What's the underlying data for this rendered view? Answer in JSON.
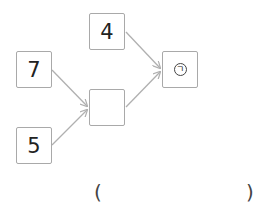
{
  "diagram": {
    "nodes": [
      {
        "id": "top",
        "value": "4"
      },
      {
        "id": "left-top",
        "value": "7"
      },
      {
        "id": "left-bottom",
        "value": "5"
      },
      {
        "id": "middle",
        "value": ""
      },
      {
        "id": "result",
        "value": "ㄱ",
        "marker": "circled"
      }
    ],
    "edges": [
      {
        "from": "left-top",
        "to": "middle"
      },
      {
        "from": "left-bottom",
        "to": "middle"
      },
      {
        "from": "middle",
        "to": "result"
      },
      {
        "from": "top",
        "to": "result"
      }
    ],
    "colors": {
      "border": "#a9a9a9",
      "arrow": "#b0b0b0",
      "text": "#222222"
    }
  },
  "answer": {
    "open": "(",
    "value": "",
    "close": ")"
  }
}
